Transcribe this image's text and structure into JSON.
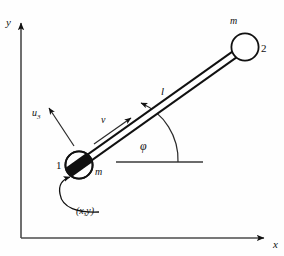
{
  "figure": {
    "type": "mechanics-diagram",
    "background_color": "#fefefe",
    "ink_color": "#111111"
  },
  "axes": {
    "x_label": "x",
    "y_label": "y",
    "origin": [
      21,
      238
    ],
    "x_end": [
      272,
      238
    ],
    "y_end": [
      21,
      16
    ]
  },
  "bodies": [
    {
      "id": "node1",
      "number_label": "1",
      "mass_label": "m",
      "center": [
        79,
        165
      ],
      "radius": 14,
      "filled_band": true
    },
    {
      "id": "node2",
      "number_label": "2",
      "mass_label": "m",
      "center": [
        245,
        47
      ],
      "radius": 14,
      "filled_band": false
    }
  ],
  "rod": {
    "length_label": "l",
    "from": [
      79,
      165
    ],
    "to": [
      245,
      47
    ],
    "angle_degrees": 35.4
  },
  "angle": {
    "label": "φ",
    "reference_line_y": 162,
    "reference_line_x_start": 116,
    "reference_line_x_end": 203
  },
  "vectors": [
    {
      "id": "velocity",
      "label": "v",
      "direction": "along-rod-upper-right"
    },
    {
      "id": "unit-vector-3",
      "label_base": "u",
      "label_sub": "3",
      "direction": "perpendicular-upper-left"
    }
  ],
  "position_callout": {
    "label": "(x,y)",
    "points_to": "node1"
  }
}
